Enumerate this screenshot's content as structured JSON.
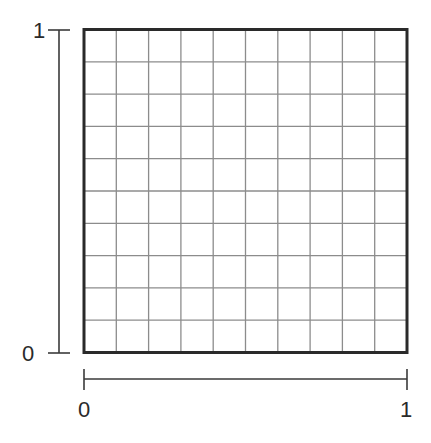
{
  "diagram": {
    "type": "unit-square-grid",
    "grid": {
      "rows": 10,
      "columns": 10,
      "grid_color": "#8c8c8c",
      "border_color": "#2a2a2a"
    },
    "y_axis": {
      "min_label": "0",
      "max_label": "1"
    },
    "x_axis": {
      "min_label": "0",
      "max_label": "1"
    },
    "colors": {
      "background": "#ffffff",
      "axis_line": "#3a3a3a",
      "label": "#2a2a2a"
    }
  }
}
